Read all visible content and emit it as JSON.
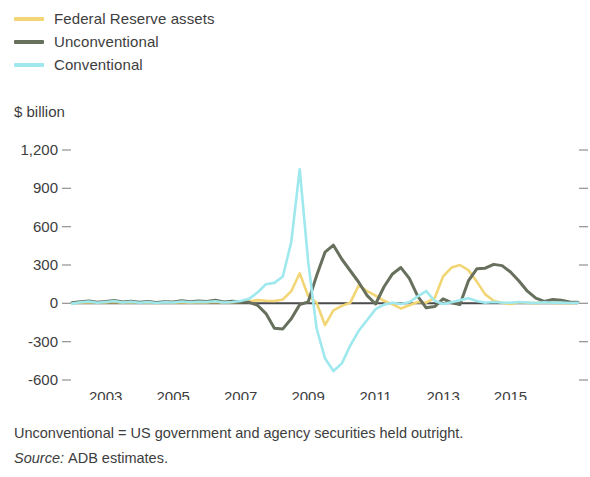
{
  "legend": {
    "position": "top-left",
    "items": [
      {
        "label": "Federal Reserve assets",
        "color": "#f2d675",
        "icon": "line-swatch"
      },
      {
        "label": "Unconventional",
        "color": "#67705d",
        "icon": "line-swatch"
      },
      {
        "label": "Conventional",
        "color": "#9ee8ee",
        "icon": "line-swatch"
      }
    ]
  },
  "axis_title": "$ billion",
  "footnotes": {
    "definition": "Unconventional = US government and agency securities held outright.",
    "source_label": "Source:",
    "source_value": "ADB estimates."
  },
  "chart_data": {
    "type": "line",
    "title": "",
    "subtitle": "",
    "xlabel": "",
    "ylabel": "$ billion",
    "ylim": [
      -600,
      1200
    ],
    "xlim": [
      2002,
      2017
    ],
    "grid": false,
    "legend_position": "top-left",
    "ytick_labels": [
      "1,200",
      "900",
      "600",
      "300",
      "0",
      "-300",
      "-600"
    ],
    "ytick_values": [
      1200,
      900,
      600,
      300,
      0,
      -300,
      -600
    ],
    "xtick_labels": [
      "2003",
      "2005",
      "2007",
      "2009",
      "2011",
      "2013",
      "2015"
    ],
    "xtick_values": [
      2003,
      2005,
      2007,
      2009,
      2011,
      2013,
      2015
    ],
    "x": [
      2002.0,
      2002.25,
      2002.5,
      2002.75,
      2003.0,
      2003.25,
      2003.5,
      2003.75,
      2004.0,
      2004.25,
      2004.5,
      2004.75,
      2005.0,
      2005.25,
      2005.5,
      2005.75,
      2006.0,
      2006.25,
      2006.5,
      2006.75,
      2007.0,
      2007.25,
      2007.5,
      2007.75,
      2008.0,
      2008.25,
      2008.5,
      2008.75,
      2009.0,
      2009.25,
      2009.5,
      2009.75,
      2010.0,
      2010.25,
      2010.5,
      2010.75,
      2011.0,
      2011.25,
      2011.5,
      2011.75,
      2012.0,
      2012.25,
      2012.5,
      2012.75,
      2013.0,
      2013.25,
      2013.5,
      2013.75,
      2014.0,
      2014.25,
      2014.5,
      2014.75,
      2015.0,
      2015.25,
      2015.5,
      2015.75,
      2016.0,
      2016.25,
      2016.5,
      2016.75,
      2017.0
    ],
    "series": [
      {
        "name": "Federal Reserve assets",
        "color": "#f2d675",
        "values": [
          2,
          5,
          8,
          4,
          6,
          10,
          5,
          8,
          4,
          6,
          3,
          7,
          5,
          8,
          4,
          9,
          6,
          10,
          5,
          8,
          10,
          15,
          25,
          20,
          18,
          30,
          95,
          235,
          60,
          5,
          -170,
          -55,
          -20,
          5,
          140,
          95,
          60,
          20,
          -8,
          -40,
          -15,
          10,
          5,
          40,
          210,
          280,
          300,
          260,
          170,
          70,
          20,
          5,
          -5,
          8,
          4,
          2,
          6,
          3,
          5,
          2,
          4
        ]
      },
      {
        "name": "Unconventional",
        "color": "#67705d",
        "values": [
          4,
          12,
          18,
          8,
          14,
          22,
          10,
          16,
          8,
          14,
          6,
          12,
          10,
          20,
          12,
          18,
          14,
          24,
          10,
          16,
          12,
          8,
          -15,
          -80,
          -195,
          -200,
          -120,
          -10,
          10,
          215,
          400,
          455,
          345,
          255,
          165,
          60,
          -5,
          130,
          230,
          280,
          195,
          55,
          -35,
          -25,
          35,
          5,
          -10,
          175,
          270,
          275,
          305,
          295,
          245,
          175,
          95,
          40,
          15,
          30,
          25,
          10,
          8
        ]
      },
      {
        "name": "Conventional",
        "color": "#9ee8ee",
        "values": [
          -2,
          8,
          14,
          4,
          10,
          18,
          6,
          12,
          5,
          10,
          3,
          8,
          6,
          14,
          8,
          12,
          10,
          16,
          6,
          10,
          18,
          35,
          85,
          150,
          160,
          210,
          480,
          1050,
          330,
          -195,
          -430,
          -530,
          -470,
          -330,
          -215,
          -130,
          -45,
          -10,
          5,
          -5,
          8,
          55,
          95,
          20,
          -5,
          8,
          25,
          40,
          18,
          5,
          10,
          6,
          4,
          10,
          6,
          3,
          8,
          4,
          6,
          3,
          5
        ]
      }
    ]
  }
}
